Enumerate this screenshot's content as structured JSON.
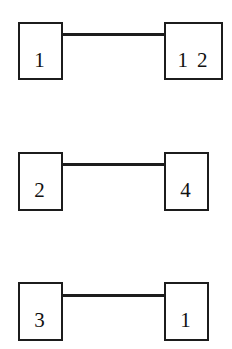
{
  "diagram": {
    "type": "node-pair-diagram",
    "background_color": "#ffffff",
    "stroke_color": "#1c1c1c",
    "text_color": "#111111",
    "rows": [
      {
        "id": "row-1",
        "left_node": {
          "label": "1"
        },
        "right_node": {
          "label": "1 2"
        },
        "edge": {
          "label": ""
        }
      },
      {
        "id": "row-2",
        "left_node": {
          "label": "2"
        },
        "right_node": {
          "label": "4"
        },
        "edge": {
          "label": ""
        }
      },
      {
        "id": "row-3",
        "left_node": {
          "label": "3"
        },
        "right_node": {
          "label": "1"
        },
        "edge": {
          "label": ""
        }
      }
    ]
  }
}
